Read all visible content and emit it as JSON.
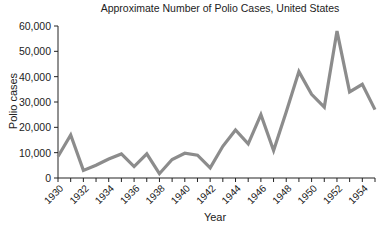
{
  "chart_data": {
    "type": "line",
    "title": "Approximate Number of Polio Cases, United States",
    "xlabel": "Year",
    "ylabel": "Polio cases",
    "x": [
      1930,
      1931,
      1932,
      1933,
      1934,
      1935,
      1936,
      1937,
      1938,
      1939,
      1940,
      1941,
      1942,
      1943,
      1944,
      1945,
      1946,
      1947,
      1948,
      1949,
      1950,
      1951,
      1952,
      1953,
      1954,
      1955
    ],
    "series": [
      {
        "name": "Polio cases",
        "color": "#8c8c8c",
        "values": [
          8500,
          17000,
          3000,
          5000,
          7500,
          9500,
          4500,
          9500,
          1700,
          7300,
          9800,
          9000,
          4000,
          12500,
          19000,
          13500,
          25000,
          10800,
          26000,
          42000,
          33000,
          28000,
          58000,
          34000,
          37000,
          27000
        ]
      }
    ],
    "ylim": [
      0,
      60000
    ],
    "xlim": [
      1930,
      1955
    ],
    "yticks": [
      0,
      10000,
      20000,
      30000,
      40000,
      50000,
      60000
    ],
    "ytick_labels": [
      "0",
      "10,000",
      "20,000",
      "30,000",
      "40,000",
      "50,000",
      "60,000"
    ],
    "xtick_labels": [
      "1930",
      "1932",
      "1934",
      "1936",
      "1938",
      "1940",
      "1942",
      "1944",
      "1946",
      "1948",
      "1950",
      "1952",
      "1954"
    ],
    "grid": false,
    "legend": "none"
  }
}
